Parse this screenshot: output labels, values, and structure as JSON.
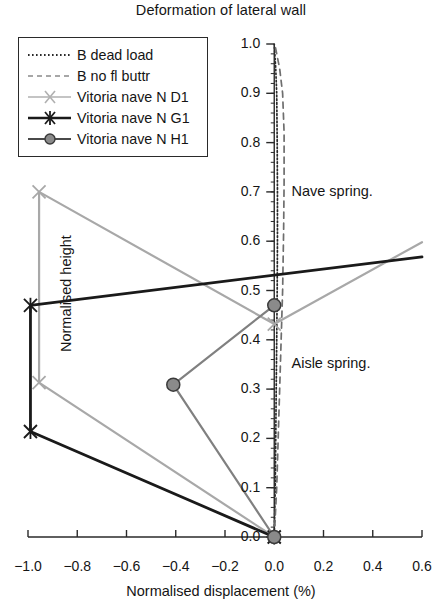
{
  "chart_data": {
    "type": "line",
    "title": "Deformation of lateral wall",
    "xlabel": "Normalised displacement (%)",
    "ylabel": "Normalised height",
    "xlim": [
      -1.0,
      0.6
    ],
    "ylim": [
      0.0,
      1.0
    ],
    "xticks": [
      "−1.0",
      "−0.8",
      "−0.6",
      "−0.4",
      "−0.2",
      "0.0",
      "0.2",
      "0.4",
      "0.6"
    ],
    "xtick_values": [
      -1.0,
      -0.8,
      -0.6,
      -0.4,
      -0.2,
      0.0,
      0.2,
      0.4,
      0.6
    ],
    "yticks": [
      "0.0",
      "0.1",
      "0.2",
      "0.3",
      "0.4",
      "0.5",
      "0.6",
      "0.7",
      "0.8",
      "0.9",
      "1.0"
    ],
    "ytick_values": [
      0.0,
      0.1,
      0.2,
      0.3,
      0.4,
      0.5,
      0.6,
      0.7,
      0.8,
      0.9,
      1.0
    ],
    "grid": false,
    "legend_position": "upper-left",
    "annotations": [
      {
        "text": "Nave spring.",
        "x": 0.07,
        "y": 0.7
      },
      {
        "text": "Aisle spring.",
        "x": 0.07,
        "y": 0.35
      }
    ],
    "series": [
      {
        "name": "B dead load",
        "style": "dotted",
        "color": "#2a2a2a",
        "marker": "none",
        "points": [
          {
            "x": 0.0,
            "y": 0.0
          },
          {
            "x": 0.004,
            "y": 0.1
          },
          {
            "x": 0.006,
            "y": 0.2
          },
          {
            "x": 0.008,
            "y": 0.3
          },
          {
            "x": 0.01,
            "y": 0.4
          },
          {
            "x": 0.012,
            "y": 0.5
          },
          {
            "x": 0.013,
            "y": 0.6
          },
          {
            "x": 0.013,
            "y": 0.7
          },
          {
            "x": 0.012,
            "y": 0.8
          },
          {
            "x": 0.01,
            "y": 0.9
          },
          {
            "x": 0.006,
            "y": 0.95
          },
          {
            "x": 0.0,
            "y": 1.0
          }
        ]
      },
      {
        "name": "B no fl buttr",
        "style": "dashed",
        "color": "#6e6e6e",
        "marker": "none",
        "points": [
          {
            "x": 0.0,
            "y": 0.0
          },
          {
            "x": 0.01,
            "y": 0.1
          },
          {
            "x": 0.016,
            "y": 0.2
          },
          {
            "x": 0.022,
            "y": 0.3
          },
          {
            "x": 0.028,
            "y": 0.4
          },
          {
            "x": 0.034,
            "y": 0.5
          },
          {
            "x": 0.038,
            "y": 0.62
          },
          {
            "x": 0.04,
            "y": 0.72
          },
          {
            "x": 0.04,
            "y": 0.82
          },
          {
            "x": 0.034,
            "y": 0.9
          },
          {
            "x": 0.022,
            "y": 0.95
          },
          {
            "x": 0.002,
            "y": 1.0
          }
        ]
      },
      {
        "name": "Vitoria nave N D1",
        "style": "solid",
        "color": "#a8a8a8",
        "marker": "x",
        "points": [
          {
            "x": 0.0,
            "y": 0.0
          },
          {
            "x": -0.955,
            "y": 0.313
          },
          {
            "x": -0.955,
            "y": 0.7
          },
          {
            "x": 0.0,
            "y": 0.432
          },
          {
            "x": 0.6,
            "y": 0.598
          }
        ]
      },
      {
        "name": "Vitoria nave N G1",
        "style": "solid",
        "color": "#1a1a1a",
        "marker": "asterisk",
        "points": [
          {
            "x": 0.0,
            "y": 0.0
          },
          {
            "x": -0.99,
            "y": 0.214
          },
          {
            "x": -0.99,
            "y": 0.47
          },
          {
            "x": 0.6,
            "y": 0.568
          }
        ]
      },
      {
        "name": "Vitoria nave N H1",
        "style": "solid",
        "color": "#808080",
        "marker": "circle",
        "points": [
          {
            "x": 0.0,
            "y": 0.0
          },
          {
            "x": -0.41,
            "y": 0.309
          },
          {
            "x": 0.0,
            "y": 0.47
          }
        ]
      }
    ]
  },
  "legend": {
    "items": [
      {
        "label": "B dead load"
      },
      {
        "label": "B no fl buttr"
      },
      {
        "label": "Vitoria nave N D1"
      },
      {
        "label": "Vitoria nave N G1"
      },
      {
        "label": "Vitoria nave N H1"
      }
    ]
  }
}
